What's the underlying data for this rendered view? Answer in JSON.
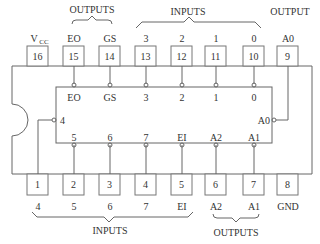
{
  "diagram": {
    "type": "ic-pinout",
    "group_labels": {
      "top_outputs": "OUTPUTS",
      "top_inputs": "INPUTS",
      "top_output": "OUTPUT",
      "bottom_inputs": "INPUTS",
      "bottom_outputs": "OUTPUTS"
    },
    "top_pins": [
      {
        "number": "16",
        "label": "VCC",
        "label_main": "V",
        "label_sub": "CC",
        "inner": ""
      },
      {
        "number": "15",
        "label": "EO",
        "inner": "EO"
      },
      {
        "number": "14",
        "label": "GS",
        "inner": "GS"
      },
      {
        "number": "13",
        "label": "3",
        "inner": "3"
      },
      {
        "number": "12",
        "label": "2",
        "inner": "2"
      },
      {
        "number": "11",
        "label": "1",
        "inner": "1"
      },
      {
        "number": "10",
        "label": "0",
        "inner": "0"
      },
      {
        "number": "9",
        "label": "A0",
        "inner": ""
      }
    ],
    "bottom_pins": [
      {
        "number": "1",
        "label": "4",
        "inner": ""
      },
      {
        "number": "2",
        "label": "5",
        "inner": "5"
      },
      {
        "number": "3",
        "label": "6",
        "inner": "6"
      },
      {
        "number": "4",
        "label": "7",
        "inner": "7"
      },
      {
        "number": "5",
        "label": "EI",
        "inner": "EI"
      },
      {
        "number": "6",
        "label": "A2",
        "inner": "A2"
      },
      {
        "number": "7",
        "label": "A1",
        "inner": "A1"
      },
      {
        "number": "8",
        "label": "GND",
        "inner": ""
      }
    ],
    "side_pins": {
      "left": "4",
      "right": "A0"
    }
  }
}
